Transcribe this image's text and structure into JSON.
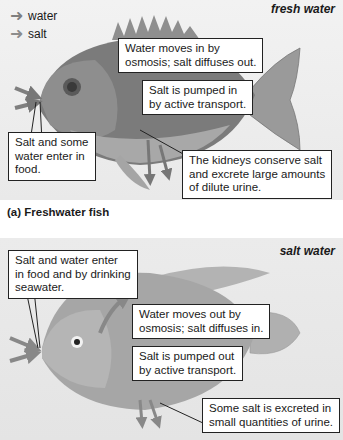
{
  "legend": {
    "water_label": "water",
    "salt_label": "salt",
    "water_color": "#7f7f7f",
    "salt_color": "#8c8c8c"
  },
  "panel_a": {
    "environment_label": "fresh water",
    "caption": "(a) Freshwater fish",
    "callouts": {
      "osmosis": "Water moves in by\nosmosis; salt diffuses out.",
      "pump": "Salt is pumped in\nby active transport.",
      "food": "Salt and some\nwater enter in\nfood.",
      "kidneys": "The kidneys conserve salt\nand excrete large amounts\nof dilute urine."
    }
  },
  "panel_b": {
    "environment_label": "salt water",
    "callouts": {
      "food": "Salt and water enter\nin food and by drinking\nseawater.",
      "osmosis": "Water moves out by\nosmosis; salt diffuses in.",
      "pump": "Salt is pumped out\nby active transport.",
      "urine": "Some salt is excreted in\nsmall quantities of urine."
    }
  }
}
